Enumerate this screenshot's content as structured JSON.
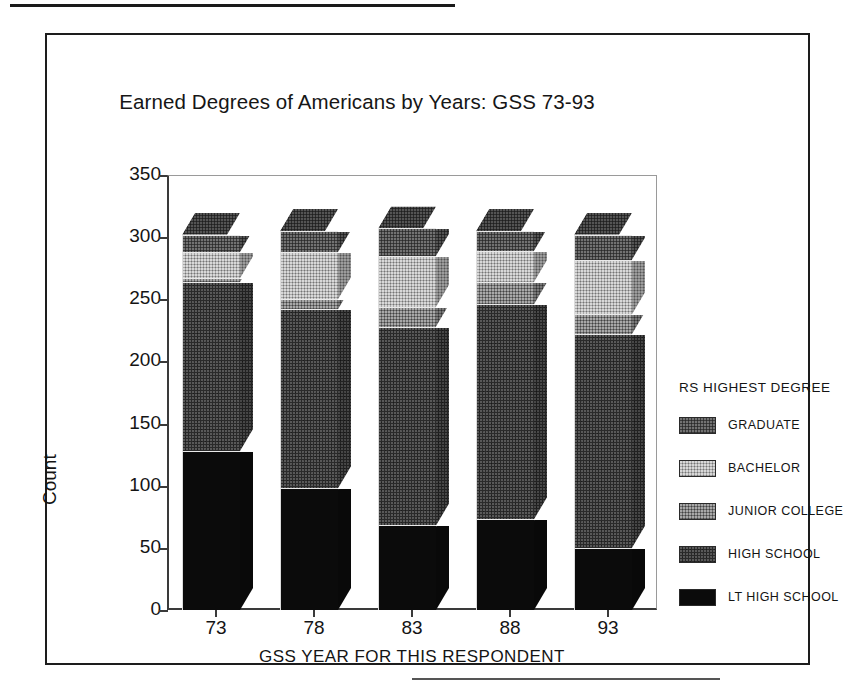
{
  "page": {
    "top_rule": "horizontal-rule",
    "bottom_rule": "horizontal-rule"
  },
  "chart_data": {
    "type": "bar",
    "subtype": "stacked-3d-column",
    "title": "Earned Degrees of Americans by Years: GSS 73-93",
    "xlabel": "GSS YEAR FOR THIS RESPONDENT",
    "ylabel": "Count",
    "categories": [
      "73",
      "78",
      "83",
      "88",
      "93"
    ],
    "ylim": [
      0,
      350
    ],
    "yticks": [
      0,
      50,
      100,
      150,
      200,
      250,
      300,
      350
    ],
    "ytick_labels": [
      "0",
      "50",
      "100",
      "150",
      "200",
      "250",
      "300",
      "350"
    ],
    "grid": false,
    "legend_position": "right",
    "legend_title": "RS HIGHEST DEGREE",
    "stack_order_bottom_to_top": [
      "LT HIGH SCHOOL",
      "HIGH SCHOOL",
      "JUNIOR COLLEGE",
      "BACHELOR",
      "GRADUATE"
    ],
    "series": [
      {
        "name": "LT HIGH SCHOOL",
        "color": "#0b0b0b",
        "values": [
          128,
          98,
          68,
          73,
          50
        ]
      },
      {
        "name": "HIGH SCHOOL",
        "color": "#2a2a2a",
        "values": [
          136,
          144,
          160,
          173,
          172
        ]
      },
      {
        "name": "JUNIOR COLLEGE",
        "color": "#6e6e6e",
        "values": [
          3,
          8,
          16,
          18,
          16
        ]
      },
      {
        "name": "BACHELOR",
        "color": "#a8a8a8",
        "values": [
          21,
          38,
          41,
          25,
          44
        ]
      },
      {
        "name": "GRADUATE",
        "color": "#3c3c3c",
        "values": [
          14,
          17,
          22,
          16,
          20
        ]
      }
    ],
    "totals": [
      302,
      305,
      307,
      305,
      302
    ]
  },
  "legend": {
    "title": "RS HIGHEST DEGREE",
    "items": [
      {
        "label": "GRADUATE",
        "swatch": "graduate-swatch",
        "fill": "f-graduate"
      },
      {
        "label": "BACHELOR",
        "swatch": "bachelor-swatch",
        "fill": "f-bachelor"
      },
      {
        "label": "JUNIOR COLLEGE",
        "swatch": "junior-college-swatch",
        "fill": "f-junior-college"
      },
      {
        "label": "HIGH SCHOOL",
        "swatch": "high-school-swatch",
        "fill": "f-high-school"
      },
      {
        "label": "LT HIGH SCHOOL",
        "swatch": "lt-high-school-swatch",
        "fill": "f-lt-high-school"
      }
    ]
  }
}
